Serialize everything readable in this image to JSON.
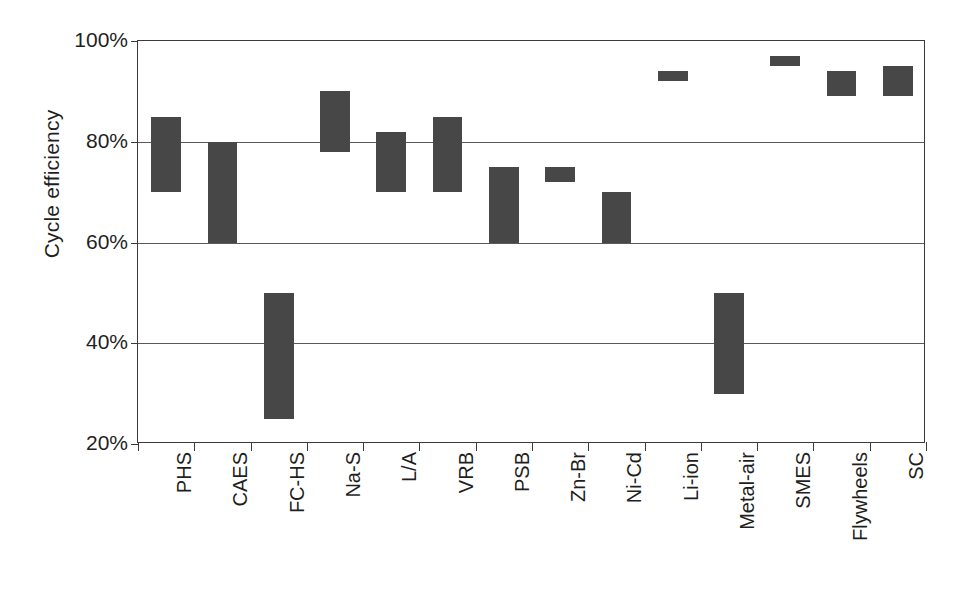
{
  "chart_data": {
    "type": "bar",
    "bar_style": "floating-range",
    "title": "",
    "subtitle": "",
    "xlabel": "",
    "ylabel": "Cycle efficiency",
    "ylim": [
      20,
      100
    ],
    "y_unit": "%",
    "y_ticks": [
      20,
      40,
      60,
      80,
      100
    ],
    "y_tick_labels": [
      "20%",
      "40%",
      "60%",
      "80%",
      "100%"
    ],
    "grid": true,
    "grid_axis": "y",
    "legend": false,
    "legend_position": "none",
    "annotations": [],
    "categories": [
      "PHS",
      "CAES",
      "FC-HS",
      "Na-S",
      "L/A",
      "VRB",
      "PSB",
      "Zn-Br",
      "Ni-Cd",
      "Li-ion",
      "Metal-air",
      "SMES",
      "Flywheels",
      "SC"
    ],
    "series": [
      {
        "name": "Cycle efficiency range",
        "low": [
          70,
          60,
          25,
          78,
          70,
          70,
          60,
          72,
          60,
          92,
          30,
          95,
          89,
          89
        ],
        "high": [
          85,
          80,
          50,
          90,
          82,
          85,
          75,
          75,
          70,
          94,
          50,
          97,
          94,
          95
        ],
        "color": "#474747"
      }
    ],
    "bar_color": "#474747",
    "axis_color": "#3a3a3a",
    "gridline_color": "#5a5a5a",
    "background_color": "#ffffff"
  }
}
